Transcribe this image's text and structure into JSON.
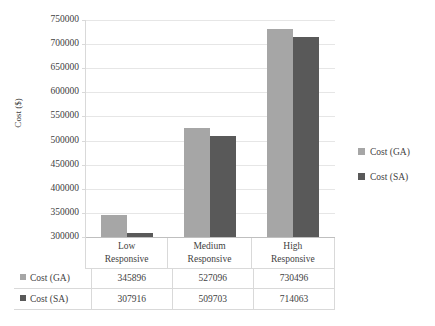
{
  "chart_data": {
    "type": "bar",
    "title": "",
    "xlabel": "",
    "ylabel": "Cost ($)",
    "ylim": [
      300000,
      750000
    ],
    "ytick_step": 50000,
    "yticks": [
      "750000",
      "700000",
      "650000",
      "600000",
      "550000",
      "500000",
      "450000",
      "400000",
      "350000",
      "300000"
    ],
    "grid": true,
    "legend_position": "right",
    "categories": [
      "Low\nResponsive",
      "Medium\nResponsive",
      "High\nResponsive"
    ],
    "category_lines": [
      [
        "Low",
        "Responsive"
      ],
      [
        "Medium",
        "Responsive"
      ],
      [
        "High",
        "Responsive"
      ]
    ],
    "series": [
      {
        "name": "Cost (GA)",
        "color": "#a6a6a6",
        "values": [
          345896,
          527096,
          730496
        ],
        "labels": [
          "345896",
          "527096",
          "730496"
        ]
      },
      {
        "name": "Cost (SA)",
        "color": "#595959",
        "values": [
          307916,
          509703,
          714063
        ],
        "labels": [
          "307916",
          "509703",
          "714063"
        ]
      }
    ]
  },
  "legend": {
    "items": [
      {
        "label": "Cost (GA)",
        "color": "#a6a6a6"
      },
      {
        "label": "Cost (SA)",
        "color": "#595959"
      }
    ]
  },
  "data_table": {
    "rows": [
      {
        "header": "Cost (GA)",
        "color": "#a6a6a6",
        "cells": [
          "345896",
          "527096",
          "730496"
        ]
      },
      {
        "header": "Cost (SA)",
        "color": "#595959",
        "cells": [
          "307916",
          "509703",
          "714063"
        ]
      }
    ]
  }
}
